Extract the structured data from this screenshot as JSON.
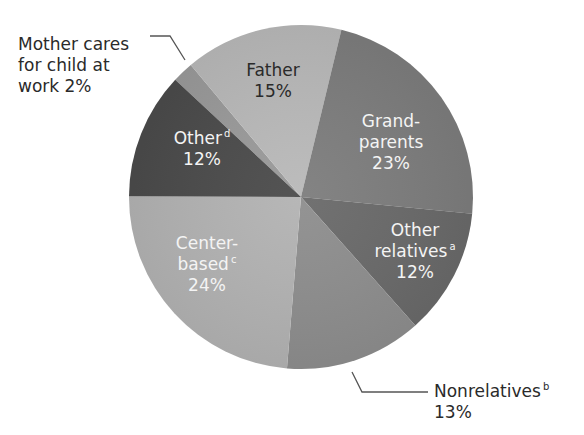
{
  "chart_data": {
    "type": "pie",
    "title": "",
    "start_angle_deg": 313,
    "direction": "clockwise",
    "slices": [
      {
        "label": "Mother cares for child at work",
        "value": 2,
        "color": "#9a9a9a"
      },
      {
        "label": "Father",
        "value": 15,
        "color": "#b9b9b9"
      },
      {
        "label": "Grandparents",
        "value": 23,
        "color": "#7d7d7d"
      },
      {
        "label": "Other relatives",
        "value": 12,
        "color": "#6a6a6a"
      },
      {
        "label": "Nonrelatives",
        "value": 13,
        "color": "#8e8e8e"
      },
      {
        "label": "Center-based",
        "value": 24,
        "color": "#b3b3b3"
      },
      {
        "label": "Other",
        "value": 12,
        "color": "#4b4b4b"
      }
    ],
    "footnote_markers": {
      "Other relatives": "a",
      "Nonrelatives": "b",
      "Center-based": "c",
      "Other": "d"
    },
    "units": "%"
  },
  "labels": {
    "mother": {
      "line1": "Mother cares",
      "line2": "for child at",
      "line3": "work  2%"
    },
    "father": {
      "line1": "Father",
      "line2": "15%"
    },
    "grandparents": {
      "line1": "Grand-",
      "line2": "parents",
      "line3": "23%"
    },
    "other_relatives": {
      "line1": "Other",
      "line2": "relatives",
      "sup": "a",
      "line3": "12%"
    },
    "nonrelatives": {
      "line1": "Nonrelatives",
      "sup": "b",
      "line2": "13%"
    },
    "center_based": {
      "line1": "Center-",
      "line2": "based",
      "sup": "c",
      "line3": "24%"
    },
    "other": {
      "line1": "Other",
      "sup": "d",
      "line2": "12%"
    }
  }
}
